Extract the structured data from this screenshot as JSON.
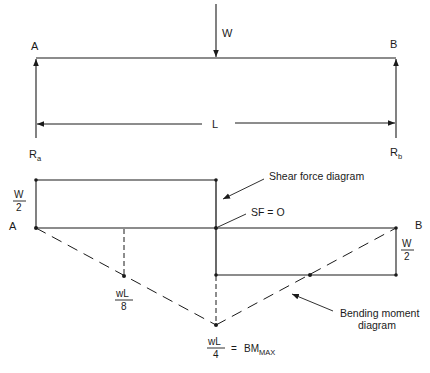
{
  "figure": {
    "type": "simply-supported beam with central point load",
    "colors": {
      "ink": "#1a1a1a",
      "background": "#ffffff"
    }
  },
  "beam": {
    "left_label": "A",
    "right_label": "B",
    "load_label": "W",
    "span_label": "L",
    "reaction_left": {
      "main": "R",
      "sub": "a"
    },
    "reaction_right": {
      "main": "R",
      "sub": "b"
    }
  },
  "shear_force_diagram": {
    "title": "Shear force diagram",
    "left_label": "A",
    "right_label": "B",
    "left_value": {
      "num": "W",
      "den": "2"
    },
    "right_value": {
      "num": "W",
      "den": "2"
    },
    "zero_label": "SF = O"
  },
  "bending_moment_diagram": {
    "title_line1": "Bending moment",
    "title_line2": "diagram",
    "quarter_value": {
      "num": "wL",
      "den": "8"
    },
    "max_value": {
      "num": "wL",
      "den": "4"
    },
    "max_eq": "=",
    "max_label": {
      "main": "BM",
      "sub": "MAX"
    }
  }
}
